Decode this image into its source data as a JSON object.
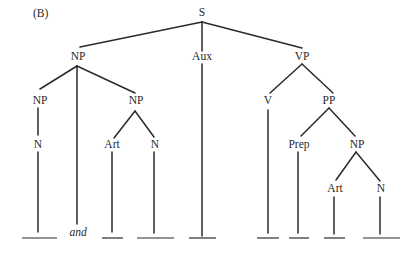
{
  "figure_label": "(B)",
  "colors": {
    "line": "#2a2a2a",
    "background": "#ffffff"
  },
  "tree": {
    "root": "S",
    "nodes": {
      "s": "S",
      "np_subject": "NP",
      "aux": "Aux",
      "vp": "VP",
      "np_conj1": "NP",
      "np_conj2": "NP",
      "n1": "N",
      "art1": "Art",
      "n2": "N",
      "v": "V",
      "pp": "PP",
      "prep": "Prep",
      "np_obj": "NP",
      "art2": "Art",
      "n3": "N"
    },
    "conjunction": "and",
    "structure": "[S [NP [NP [N _]] and [NP [Art _] [N _]]] [Aux _] [VP [V _] [PP [Prep _] [NP [Art _] [N _]]]]]",
    "blank_slots": 9
  }
}
